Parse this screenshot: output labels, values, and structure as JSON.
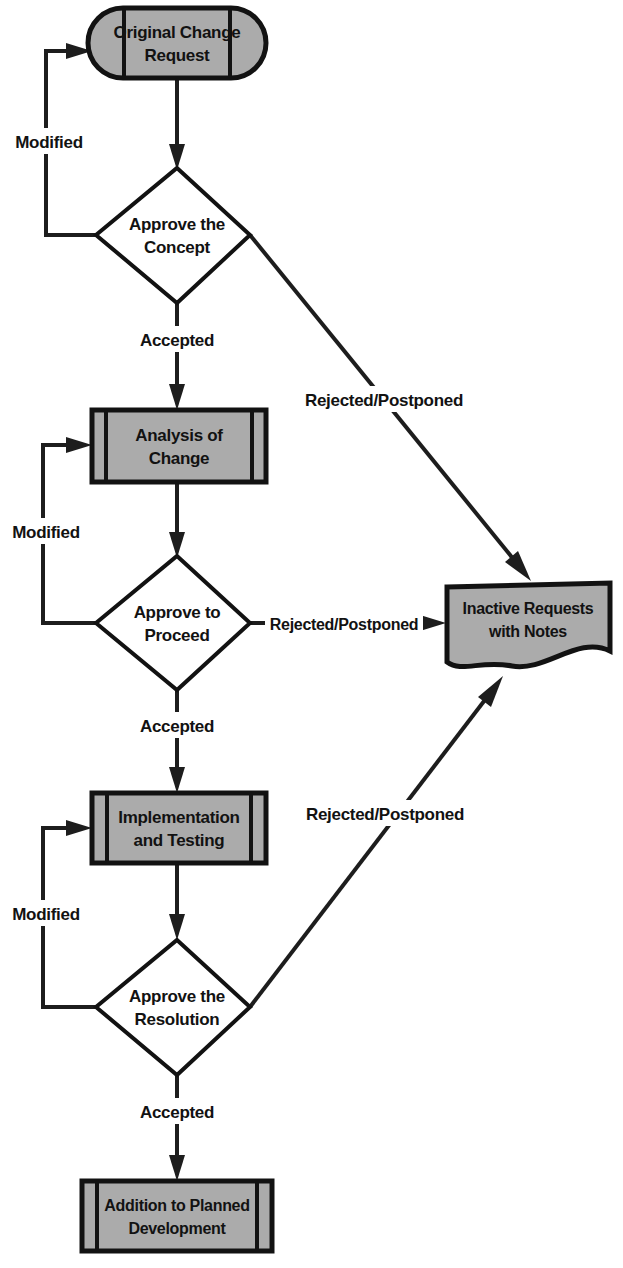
{
  "diagram": {
    "colors": {
      "node_fill": "#ababab",
      "outline": "#121212",
      "line": "#1d1d1d",
      "background": "#ffffff"
    },
    "nodes": [
      {
        "id": "original-change-request",
        "shape": "terminator",
        "label_line1": "Original Change",
        "label_line2": "Request"
      },
      {
        "id": "approve-the-concept",
        "shape": "decision",
        "label_line1": "Approve the",
        "label_line2": "Concept"
      },
      {
        "id": "analysis-of-change",
        "shape": "predefined-process",
        "label_line1": "Analysis of",
        "label_line2": "Change"
      },
      {
        "id": "approve-to-proceed",
        "shape": "decision",
        "label_line1": "Approve to",
        "label_line2": "Proceed"
      },
      {
        "id": "implementation-and-testing",
        "shape": "predefined-process",
        "label_line1": "Implementation",
        "label_line2": "and Testing"
      },
      {
        "id": "approve-the-resolution",
        "shape": "decision",
        "label_line1": "Approve the",
        "label_line2": "Resolution"
      },
      {
        "id": "addition-to-planned-development",
        "shape": "predefined-process",
        "label_line1": "Addition to Planned",
        "label_line2": "Development"
      },
      {
        "id": "inactive-requests-with-notes",
        "shape": "document",
        "label_line1": "Inactive Requests",
        "label_line2": "with Notes"
      }
    ],
    "edge_labels": {
      "modified_1": "Modified",
      "modified_2": "Modified",
      "modified_3": "Modified",
      "accepted_1": "Accepted",
      "accepted_2": "Accepted",
      "accepted_3": "Accepted",
      "rejected_1": "Rejected/Postponed",
      "rejected_2": "Rejected/Postponed",
      "rejected_3": "Rejected/Postponed"
    }
  }
}
